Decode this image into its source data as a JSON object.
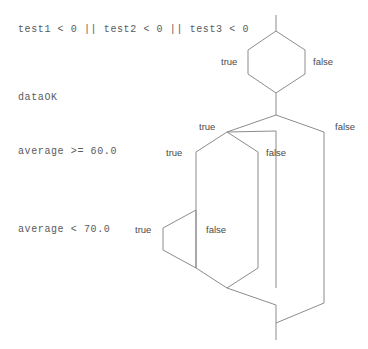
{
  "diagram": {
    "type": "nested-decision-flowchart",
    "background_color": "#ffffff",
    "line_color": "#8c8c8c",
    "text_color": "#5a5a5a",
    "conditions": [
      {
        "id": "cond-test",
        "label": "test1 < 0 || test2 < 0 || test3 < 0"
      },
      {
        "id": "cond-dataok",
        "label": "dataOK"
      },
      {
        "id": "cond-avg60",
        "label": "average >= 60.0"
      },
      {
        "id": "cond-avg70",
        "label": "average < 70.0"
      }
    ],
    "branch_labels": [
      {
        "id": "test-true",
        "text": "true"
      },
      {
        "id": "test-false",
        "text": "false"
      },
      {
        "id": "dataok-true",
        "text": "true"
      },
      {
        "id": "dataok-false",
        "text": "false"
      },
      {
        "id": "avg60-true",
        "text": "true"
      },
      {
        "id": "avg60-false",
        "text": "false"
      },
      {
        "id": "avg70-true",
        "text": "true"
      },
      {
        "id": "avg70-false",
        "text": "false"
      }
    ]
  }
}
